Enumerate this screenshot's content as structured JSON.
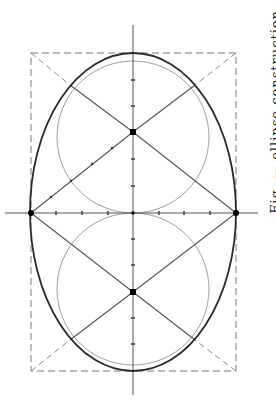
{
  "figure": {
    "colors": {
      "background": "#ffffff",
      "ellipse": "#2a2a2a",
      "construction_lines": "#555555",
      "circles": "#9a9a9a",
      "dashed_rect": "#777777",
      "points": "#000000"
    },
    "axes": {
      "vertical": {
        "x": 133,
        "y1": 25,
        "y2": 395
      },
      "horizontal": {
        "y": 213,
        "x1": 5,
        "x2": 258
      },
      "tick_spacing_px": 26
    },
    "bounding_rect": {
      "x": 31,
      "y": 53,
      "width": 205,
      "height": 318,
      "style": "dashed"
    },
    "ellipse": {
      "cx": 133,
      "cy": 212,
      "rx": 103,
      "ry": 159
    },
    "circles": [
      {
        "name": "upper-circle",
        "cx": 133,
        "cy": 137,
        "r": 76
      },
      {
        "name": "lower-circle",
        "cx": 133,
        "cy": 289,
        "r": 76
      }
    ],
    "points": [
      {
        "name": "left-vertex",
        "x": 31,
        "y": 213
      },
      {
        "name": "right-vertex",
        "x": 236,
        "y": 213
      },
      {
        "name": "upper-focus",
        "x": 133,
        "y": 132
      },
      {
        "name": "lower-focus",
        "x": 133,
        "y": 292
      },
      {
        "name": "center",
        "x": 133,
        "y": 213
      }
    ]
  },
  "edge_text": {
    "label": "Fig. — ellipse construction"
  }
}
